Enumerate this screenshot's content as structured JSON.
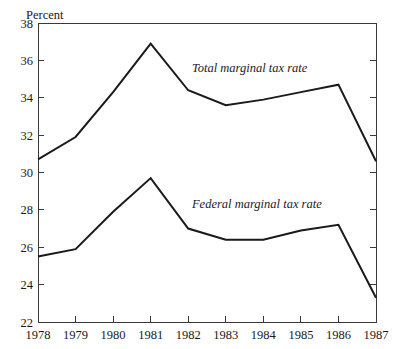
{
  "chart_data": {
    "type": "line",
    "title": "",
    "subtitle": "",
    "xlabel": "",
    "ylabel": "Percent",
    "ylabel_position": "top-left-above-axis",
    "x": [
      "1978",
      "1979",
      "1980",
      "1981",
      "1982",
      "1983",
      "1984",
      "1985",
      "1986",
      "1987"
    ],
    "categories": [
      "1978",
      "1979",
      "1980",
      "1981",
      "1982",
      "1983",
      "1984",
      "1985",
      "1986",
      "1987"
    ],
    "xlim": [
      "1978",
      "1987"
    ],
    "ylim": [
      22,
      38
    ],
    "ytick_step": 2,
    "yticks": [
      22,
      24,
      26,
      28,
      30,
      32,
      34,
      36,
      38
    ],
    "ytick_labels": [
      "22",
      "24",
      "26",
      "28",
      "30",
      "32",
      "34",
      "36",
      "38"
    ],
    "xticks": [
      "1978",
      "1979",
      "1980",
      "1981",
      "1982",
      "1983",
      "1984",
      "1985",
      "1986",
      "1987"
    ],
    "grid": false,
    "legend": "inline-annotations",
    "legend_position": "inline",
    "line_color": "#1a1a1a",
    "axis_color": "#3a3a3a",
    "background_color": "#ffffff",
    "series": [
      {
        "name": "Total marginal tax rate",
        "annotation": "Total marginal tax rate",
        "annotation_x": 1982.1,
        "annotation_y": 35.4,
        "values": [
          30.7,
          31.9,
          34.3,
          36.9,
          34.4,
          33.6,
          33.9,
          34.3,
          34.7,
          30.6
        ]
      },
      {
        "name": "Federal marginal tax rate",
        "annotation": "Federal marginal tax rate",
        "annotation_x": 1982.1,
        "annotation_y": 28.1,
        "values": [
          25.5,
          25.9,
          27.9,
          29.7,
          27.0,
          26.4,
          26.4,
          26.9,
          27.2,
          23.3
        ]
      }
    ]
  }
}
